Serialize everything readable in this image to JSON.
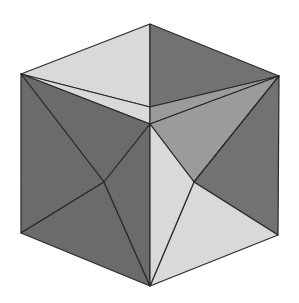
{
  "figure": {
    "colors": {
      "background": "#ffffff",
      "light": "#d9d9d9",
      "medium": "#9b9b9b",
      "dark": "#727272",
      "darker": "#6b6b6b",
      "edge": "#2a2a2a"
    },
    "vertices": {
      "top": [
        150,
        24
      ],
      "left": [
        21,
        74
      ],
      "right": [
        279,
        76
      ],
      "center": [
        150,
        124
      ],
      "top_inner": [
        150,
        107
      ],
      "bottom_left": [
        21,
        233
      ],
      "bottom_right": [
        278,
        235
      ],
      "bottom": [
        150,
        286
      ],
      "left_inner": [
        104,
        182
      ],
      "right_inner": [
        194,
        182
      ]
    },
    "facets": [
      {
        "name": "top-left-facet",
        "points": "150,24 21,74 150,107",
        "fill": "light"
      },
      {
        "name": "top-right-facet",
        "points": "150,24 279,76 150,107",
        "fill": "dark"
      },
      {
        "name": "top-left-strip-facet",
        "points": "21,74 150,107 150,124",
        "fill": "light"
      },
      {
        "name": "top-right-strip-facet",
        "points": "279,76 150,107 150,124",
        "fill": "medium"
      },
      {
        "name": "left-face-top-facet",
        "points": "21,74 150,124 104,182",
        "fill": "darker"
      },
      {
        "name": "left-face-outer-facet",
        "points": "21,74 21,233 104,182",
        "fill": "darker"
      },
      {
        "name": "left-face-bottom-facet",
        "points": "21,233 150,286 104,182",
        "fill": "darker"
      },
      {
        "name": "left-face-inner-facet",
        "points": "150,124 150,286 104,182",
        "fill": "darker"
      },
      {
        "name": "right-face-top-facet",
        "points": "150,124 279,76 194,182",
        "fill": "medium"
      },
      {
        "name": "right-face-outer-facet",
        "points": "279,76 278,235 194,182",
        "fill": "dark"
      },
      {
        "name": "right-face-bottom-facet",
        "points": "278,235 150,286 194,182",
        "fill": "light"
      },
      {
        "name": "right-face-inner-facet",
        "points": "150,286 150,124 194,182",
        "fill": "light"
      }
    ]
  }
}
